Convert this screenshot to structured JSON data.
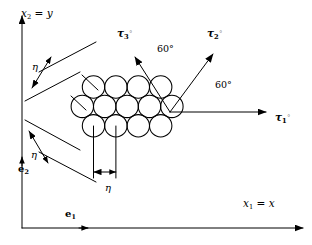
{
  "figure": {
    "background_color": "#ffffff",
    "stroke_color": "#000000",
    "width": 312,
    "height": 245
  },
  "axes": {
    "x_axis": {
      "label_html": "x<sub>1</sub> = x",
      "label_x": 243,
      "label_y": 198,
      "line": {
        "x1": 22,
        "y1": 228,
        "x2": 303,
        "y2": 228
      },
      "mid_arrow_x": 88
    },
    "y_axis": {
      "label_html": "x<sub>2</sub> = y",
      "label_x": 21,
      "label_y": 8,
      "line": {
        "x1": 22,
        "y1": 228,
        "x2": 22,
        "y2": 16
      },
      "mid_arrow_y": 157
    }
  },
  "basis_vectors": [
    {
      "name": "e1",
      "label_html": "e<sub>1</sub>",
      "x": 65,
      "y": 209
    },
    {
      "name": "e2",
      "label_html": "e<sub>2</sub>",
      "x": 18,
      "y": 164
    }
  ],
  "lattice": {
    "type": "hexagonal-close-packed",
    "circle_radius": 11.2,
    "row_spacing": 19.4,
    "column_spacing": 22.4,
    "rows": [
      {
        "row_index": 0,
        "count": 4,
        "cy": 87,
        "cx_start": 93.5
      },
      {
        "row_index": 1,
        "count": 5,
        "cy": 106.4,
        "cx_start": 82.3
      },
      {
        "row_index": 2,
        "count": 4,
        "cy": 125.8,
        "cx_start": 93.5
      }
    ]
  },
  "direction_arrows": [
    {
      "name": "tau1",
      "label_html": "τ<sub>1</sub><sup>◦</sup>",
      "label_x": 275,
      "label_y": 112,
      "from": {
        "x": 170,
        "y": 112
      },
      "to": {
        "x": 266,
        "y": 112
      },
      "angle_deg": 0
    },
    {
      "name": "tau2",
      "label_html": "τ<sub>2</sub><sup>◦</sup>",
      "label_x": 207,
      "label_y": 28,
      "from": {
        "x": 170,
        "y": 112
      },
      "to": {
        "x": 213,
        "y": 54
      },
      "angle_deg": 60
    },
    {
      "name": "tau3",
      "label_html": "τ<sub>3</sub><sup>◦</sup>",
      "label_x": 117,
      "label_y": 28,
      "from": {
        "x": 170,
        "y": 112
      },
      "to": {
        "x": 135,
        "y": 57
      },
      "angle_deg": 120
    }
  ],
  "angle_annotations": [
    {
      "name": "angle-tau3-tau2",
      "text": "60°",
      "x": 157,
      "y": 44
    },
    {
      "name": "angle-tau2-tau1",
      "text": "60°",
      "x": 215,
      "y": 80
    }
  ],
  "eta_dimensions": [
    {
      "name": "eta-upper-left",
      "label": "η",
      "label_x": 32,
      "label_y": 62,
      "guide_a": {
        "x1": 39,
        "y1": 72,
        "x2": 96,
        "y2": 42
      },
      "guide_b": {
        "x1": 25,
        "y1": 101,
        "x2": 80,
        "y2": 72
      },
      "arrow": {
        "x1": 32,
        "y1": 88,
        "x2": 51,
        "y2": 57
      }
    },
    {
      "name": "eta-lower-left",
      "label": "η",
      "label_x": 31,
      "label_y": 150,
      "guide_a": {
        "x1": 25,
        "y1": 120,
        "x2": 80,
        "y2": 150
      },
      "guide_b": {
        "x1": 39,
        "y1": 152,
        "x2": 96,
        "y2": 182
      },
      "arrow": {
        "x1": 29,
        "y1": 131,
        "x2": 48,
        "y2": 163
      }
    },
    {
      "name": "eta-bottom",
      "label": "η",
      "label_x": 105,
      "label_y": 183,
      "leader_a": {
        "x1": 93.5,
        "y1": 126,
        "x2": 93.5,
        "y2": 178
      },
      "leader_b": {
        "x1": 115.9,
        "y1": 126,
        "x2": 115.9,
        "y2": 178
      },
      "arrow": {
        "x1": 93.5,
        "y1": 172,
        "x2": 115.9,
        "y2": 172
      }
    }
  ],
  "center_markers": [
    {
      "name": "center-mark-top-left",
      "x1": 82,
      "y1": 75,
      "x2": 98,
      "y2": 90
    },
    {
      "name": "center-mark-mid-left",
      "x1": 71,
      "y1": 96,
      "x2": 86,
      "y2": 110
    }
  ]
}
